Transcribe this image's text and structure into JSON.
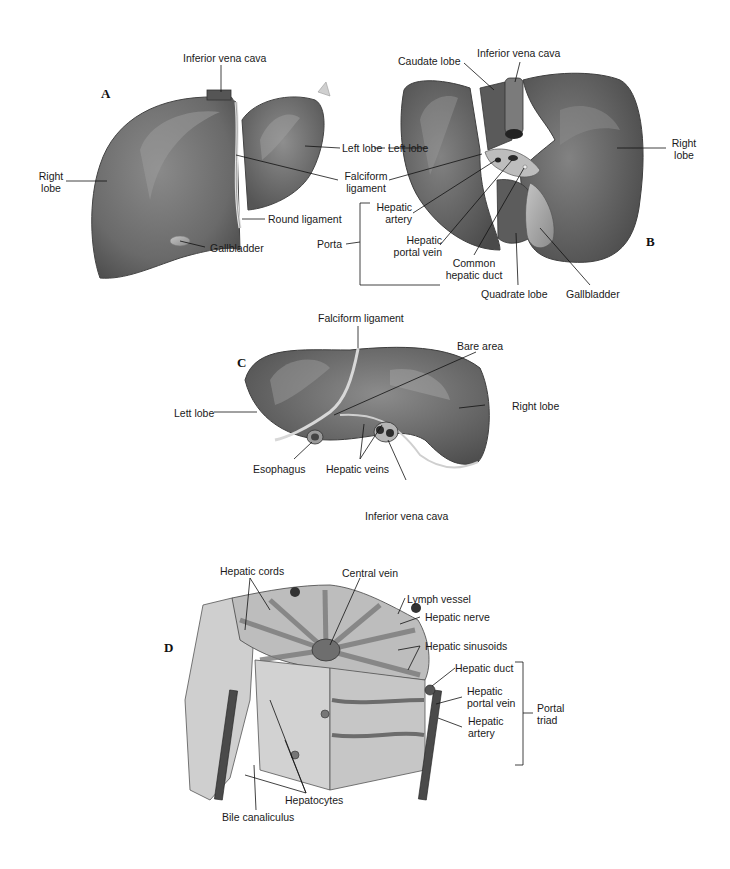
{
  "figure": {
    "panels": [
      {
        "id": "A",
        "letter": "A",
        "labels": {
          "ivc": "Inferior vena cava",
          "right_lobe_1": "Right",
          "right_lobe_2": "lobe",
          "left_lobe": "Left lobe",
          "round_ligament": "Round ligament",
          "gallbladder": "Gallbladder"
        }
      },
      {
        "id": "B",
        "letter": "B",
        "labels": {
          "caudate_lobe": "Caudate lobe",
          "ivc": "Inferior vena cava",
          "left_lobe": "Left lobe",
          "right_lobe_1": "Right",
          "right_lobe_2": "lobe",
          "falciform_1": "Falciform",
          "falciform_2": "ligament",
          "hepatic_artery_1": "Hepatic",
          "hepatic_artery_2": "artery",
          "porta": "Porta",
          "portal_vein_1": "Hepatic",
          "portal_vein_2": "portal vein",
          "common_duct_1": "Common",
          "common_duct_2": "hepatic duct",
          "quadrate_lobe": "Quadrate lobe",
          "gallbladder": "Gallbladder"
        }
      },
      {
        "id": "C",
        "letter": "C",
        "labels": {
          "falciform": "Falciform ligament",
          "bare_area": "Bare area",
          "left_lobe": "Lett lobe",
          "right_lobe": "Right lobe",
          "esophagus": "Esophagus",
          "hepatic_veins": "Hepatic veins",
          "ivc": "Inferior vena cava"
        }
      },
      {
        "id": "D",
        "letter": "D",
        "labels": {
          "hepatic_cords": "Hepatic cords",
          "central_vein": "Central vein",
          "lymph_vessel": "Lymph vessel",
          "hepatic_nerve": "Hepatic nerve",
          "hepatic_sinusoids": "Hepatic sinusoids",
          "hepatic_duct": "Hepatic duct",
          "portal_vein_1": "Hepatic",
          "portal_vein_2": "portal vein",
          "hepatic_artery_1": "Hepatic",
          "hepatic_artery_2": "artery",
          "portal_triad_1": "Portal",
          "portal_triad_2": "triad",
          "hepatocytes": "Hepatocytes",
          "bile_canaliculus": "Bile canaliculus"
        }
      }
    ],
    "colors": {
      "liver_dark": "#5e5e5e",
      "liver_mid": "#7a7a7a",
      "liver_light": "#a8a8a8",
      "ligament": "#d8d8d8",
      "gallbladder": "#9c9c9c",
      "lobule_fill": "#c9c9c9",
      "vessel_dark": "#3e3e3e"
    }
  }
}
